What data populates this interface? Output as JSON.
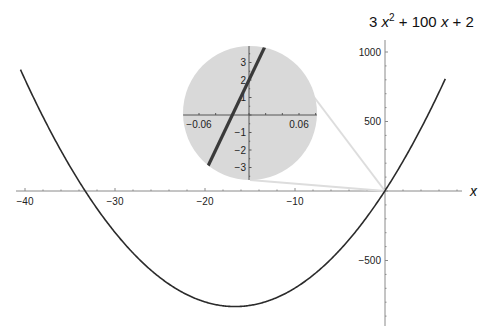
{
  "chart_data": {
    "type": "line",
    "title_parts": {
      "a": "3 ",
      "x1": "x",
      "sup": "2",
      "mid": " + 100 ",
      "x2": "x",
      "end": " + 2"
    },
    "function": "3*x^2 + 100*x + 2",
    "xlabel": "x",
    "ylabel": "",
    "xlim": [
      -41.5,
      10.5
    ],
    "ylim": [
      -970,
      1100
    ],
    "x_ticks": [
      -40,
      -30,
      -20,
      -10
    ],
    "x_tick_labels": [
      "-40",
      "-30",
      "-20",
      "-10"
    ],
    "y_ticks": [
      1000,
      500,
      -500
    ],
    "y_tick_labels": [
      "1000",
      "500",
      "-500"
    ],
    "grid": false,
    "legend": null,
    "series": [
      {
        "name": "3 x^2 + 100 x + 2",
        "color": "#2b2b2b",
        "x": [
          -40.5,
          -40,
          -35,
          -33.31,
          -30,
          -25,
          -20,
          -16.67,
          -15,
          -10,
          -5,
          0,
          5,
          6.7
        ],
        "y": [
          878.75,
          802,
          177,
          0,
          -598,
          -623,
          -798,
          -831.3,
          -823,
          -698,
          -423,
          2,
          577,
          1039.7
        ]
      }
    ],
    "key_points": {
      "vertex": {
        "x": -16.67,
        "y": -831.3
      },
      "roots": [
        -33.31,
        -0.02
      ],
      "y_intercept": 2
    },
    "inset": {
      "type": "line",
      "shape": "circle",
      "background": "#d9d9d9",
      "zoom_center": [
        0,
        0
      ],
      "xlim": [
        -0.08,
        0.08
      ],
      "ylim": [
        -3.8,
        3.8
      ],
      "x_ticks": [
        -0.06,
        0.06
      ],
      "x_tick_labels": [
        "-0.06",
        "0.06"
      ],
      "y_ticks": [
        3,
        2,
        1,
        -1,
        -2,
        -3
      ],
      "y_tick_labels": [
        "3",
        "2",
        "1",
        "-1",
        "-2",
        "-3"
      ],
      "series": [
        {
          "name": "3 x^2 + 100 x + 2 (zoom)",
          "color": "#3a3a3a",
          "x": [
            -0.05,
            -0.02,
            0,
            0.016
          ],
          "y": [
            -3.0,
            0,
            2.0,
            3.6
          ]
        }
      ]
    }
  }
}
